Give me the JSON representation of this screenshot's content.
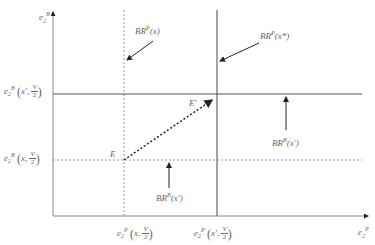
{
  "diagram": {
    "axes": {
      "y_label": {
        "base": "e",
        "sub": "2",
        "sup": "B"
      },
      "x_label": {
        "base": "e",
        "sub": "2",
        "sup": "P"
      }
    },
    "y_ticks": [
      {
        "base": "e",
        "sub": "2",
        "sup": "B",
        "arg": "x",
        "arg_mark": "′",
        "frac_num": "V",
        "frac_den": "2"
      },
      {
        "base": "e",
        "sub": "2",
        "sup": "B",
        "arg": "x",
        "arg_mark": "",
        "frac_num": "V",
        "frac_den": "2"
      }
    ],
    "x_ticks": [
      {
        "base": "e",
        "sub": "2",
        "sup": "P",
        "arg": "x",
        "arg_mark": "",
        "frac_num": "V",
        "frac_den": "2"
      },
      {
        "base": "e",
        "sub": "2",
        "sup": "P",
        "arg": "x",
        "arg_mark": "′",
        "frac_num": "V",
        "frac_den": "2"
      }
    ],
    "curve_labels": [
      {
        "id": "BRP_x",
        "text": "BR",
        "sup": "P",
        "arg": "(x)"
      },
      {
        "id": "BRP_xstar",
        "text": "BR",
        "sup": "P",
        "arg": "(x*)"
      },
      {
        "id": "BRB_xprime_upper",
        "text": "BR",
        "sup": "B",
        "arg": "(x′)"
      },
      {
        "id": "BRB_xprime_lower",
        "text": "BR",
        "sup": "B",
        "arg": "(x′)"
      }
    ],
    "points": [
      {
        "id": "E",
        "label": "E"
      },
      {
        "id": "E_prime",
        "label": "E′"
      }
    ],
    "colors": {
      "solid": "#555555",
      "dashed": "#777777",
      "arrow": "#222222"
    }
  }
}
